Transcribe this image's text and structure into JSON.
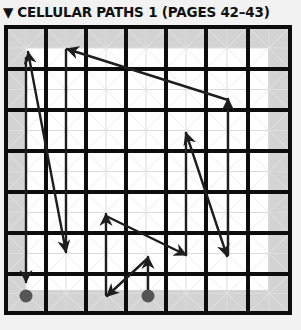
{
  "header": {
    "marker_icon": "▼",
    "title": "CELLULAR PATHS 1 (PAGES 42–43)"
  },
  "colors": {
    "background": "#f2f2f2",
    "frame_gray": "#d3d3d3",
    "inner_white": "#ffffff",
    "grid_thick": "#0d0d0d",
    "grid_thin": "#dcdcdc",
    "path": "#1e1e1e",
    "dot": "#555555"
  },
  "grid": {
    "left": 6,
    "top": 27,
    "right": 290,
    "bottom": 313,
    "thick_x": [
      6,
      46,
      86,
      126,
      166,
      206,
      248,
      290
    ],
    "thick_y": [
      27,
      69,
      110,
      151,
      192,
      233,
      274,
      313
    ],
    "inner": {
      "left": 26,
      "top": 48,
      "right": 268,
      "bottom": 290
    }
  },
  "dots": [
    {
      "x": 26,
      "y": 296
    },
    {
      "x": 148,
      "y": 296
    }
  ],
  "paths": [
    {
      "x1": 26,
      "y1": 58,
      "x2": 26,
      "y2": 282,
      "head_end": true,
      "head_start": false
    },
    {
      "x1": 66,
      "y1": 252,
      "x2": 28,
      "y2": 52,
      "head_end": true,
      "head_start": true
    },
    {
      "x1": 66,
      "y1": 50,
      "x2": 66,
      "y2": 252,
      "head_end": false,
      "head_start": false
    },
    {
      "x1": 228,
      "y1": 100,
      "x2": 67,
      "y2": 49,
      "head_end": true,
      "head_start": false
    },
    {
      "x1": 228,
      "y1": 255,
      "x2": 228,
      "y2": 99,
      "head_end": true,
      "head_start": false
    },
    {
      "x1": 227,
      "y1": 256,
      "x2": 186,
      "y2": 133,
      "head_end": true,
      "head_start": true
    },
    {
      "x1": 186,
      "y1": 133,
      "x2": 186,
      "y2": 255,
      "head_end": false,
      "head_start": false
    },
    {
      "x1": 106,
      "y1": 216,
      "x2": 186,
      "y2": 255,
      "head_end": true,
      "head_start": false
    },
    {
      "x1": 106,
      "y1": 295,
      "x2": 106,
      "y2": 214,
      "head_end": true,
      "head_start": false
    },
    {
      "x1": 148,
      "y1": 258,
      "x2": 107,
      "y2": 296,
      "head_end": true,
      "head_start": false
    },
    {
      "x1": 148,
      "y1": 296,
      "x2": 148,
      "y2": 257,
      "head_end": true,
      "head_start": false
    }
  ]
}
